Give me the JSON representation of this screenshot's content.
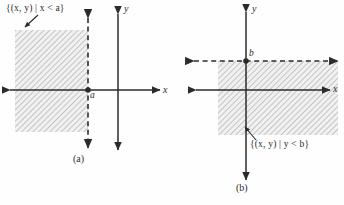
{
  "figure": {
    "background_color": "#fefefe",
    "ink_color": "#2b2b2b",
    "hatch_color": "#b9b9b9",
    "hatch_fill_color": "#f0f0f0"
  },
  "panel_a": {
    "caption": "(a)",
    "set_label": "{(x, y) | x < a}",
    "x_axis_label": "x",
    "y_axis_label": "y",
    "boundary_point_label": "a",
    "boundary_style": "dashed",
    "region_description": "half-plane left of vertical line x = a",
    "region": {
      "x": 15,
      "y": 30,
      "width": 73,
      "height": 102
    },
    "axes": {
      "x_axis_y": 90,
      "y_axis_x": 118
    },
    "boundary_line_x": 88
  },
  "panel_b": {
    "caption": "(b)",
    "set_label": "{(x, y) | y < b}",
    "x_axis_label": "x",
    "y_axis_label": "y",
    "boundary_point_label": "b",
    "boundary_style": "dashed",
    "region_description": "half-plane below horizontal line y = b",
    "region": {
      "x": 46,
      "y": 61,
      "width": 120,
      "height": 74
    },
    "axes": {
      "x_axis_y": 90,
      "y_axis_x": 74
    },
    "boundary_line_y": 61
  }
}
